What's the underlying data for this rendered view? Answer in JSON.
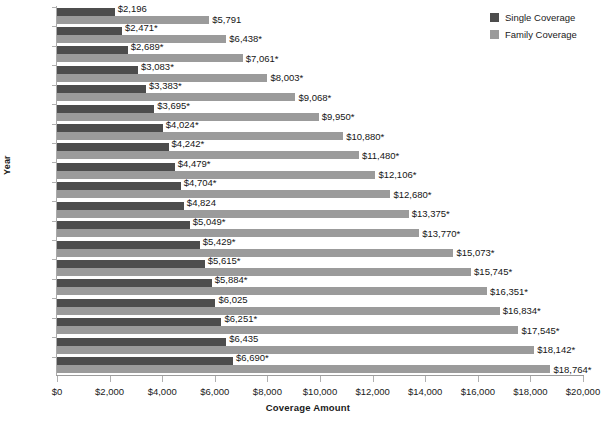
{
  "chart_data": {
    "type": "bar",
    "orientation": "horizontal",
    "title": "",
    "xlabel": "Coverage Amount",
    "ylabel": "Year",
    "xlim": [
      0,
      20000
    ],
    "grid": false,
    "legend_position": "top-right",
    "categories": [
      "1999",
      "2000",
      "2001",
      "2002",
      "2003",
      "2004",
      "2005",
      "2006",
      "2007",
      "2008",
      "2009",
      "2010",
      "2011",
      "2012",
      "2013",
      "2014",
      "2015",
      "2016",
      "2017"
    ],
    "xtick_labels": [
      "$0",
      "$2,000",
      "$4,000",
      "$6,000",
      "$8,000",
      "$10,000",
      "$12,000",
      "$14,000",
      "$16,000",
      "$18,000",
      "$20,000"
    ],
    "xtick_values": [
      0,
      2000,
      4000,
      6000,
      8000,
      10000,
      12000,
      14000,
      16000,
      18000,
      20000
    ],
    "series": [
      {
        "name": "Single Coverage",
        "color": "#4d4d4d",
        "values": [
          2196,
          2471,
          2689,
          3083,
          3383,
          3695,
          4024,
          4242,
          4479,
          4704,
          4824,
          5049,
          5429,
          5615,
          5884,
          6025,
          6251,
          6435,
          6690
        ],
        "labels": [
          "$2,196",
          "$2,471*",
          "$2,689*",
          "$3,083*",
          "$3,383*",
          "$3,695*",
          "$4,024*",
          "$4,242*",
          "$4,479*",
          "$4,704*",
          "$4,824",
          "$5,049*",
          "$5,429*",
          "$5,615*",
          "$5,884*",
          "$6,025",
          "$6,251*",
          "$6,435",
          "$6,690*"
        ]
      },
      {
        "name": "Family Coverage",
        "color": "#9b9b9b",
        "values": [
          5791,
          6438,
          7061,
          8003,
          9068,
          9950,
          10880,
          11480,
          12106,
          12680,
          13375,
          13770,
          15073,
          15745,
          16351,
          16834,
          17545,
          18142,
          18764
        ],
        "labels": [
          "$5,791",
          "$6,438*",
          "$7,061*",
          "$8,003*",
          "$9,068*",
          "$9,950*",
          "$10,880*",
          "$11,480*",
          "$12,106*",
          "$12,680*",
          "$13,375*",
          "$13,770*",
          "$15,073*",
          "$15,745*",
          "$16,351*",
          "$16,834*",
          "$17,545*",
          "$18,142*",
          "$18,764*"
        ]
      }
    ]
  },
  "legend": {
    "items": [
      {
        "label": "Single Coverage",
        "color": "#4d4d4d"
      },
      {
        "label": "Family Coverage",
        "color": "#9b9b9b"
      }
    ]
  },
  "axes": {
    "x_title": "Coverage Amount",
    "y_title": "Year"
  }
}
